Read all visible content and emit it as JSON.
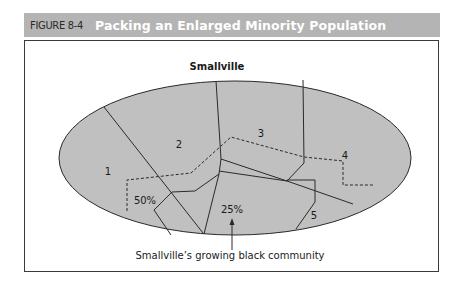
{
  "figure": {
    "number": "FIGURE 8-4",
    "title": "Packing an Enlarged Minority Population"
  },
  "diagram": {
    "city_name": "Smallville",
    "districts": [
      {
        "id": "1",
        "label": "1"
      },
      {
        "id": "2",
        "label": "2"
      },
      {
        "id": "3",
        "label": "3"
      },
      {
        "id": "4",
        "label": "4"
      },
      {
        "id": "5",
        "label": "5"
      }
    ],
    "percentages": [
      {
        "label": "50%"
      },
      {
        "label": "25%"
      }
    ],
    "annotation": "Smallville’s growing black community"
  },
  "colors": {
    "header_bg": "#b4b4b4",
    "ellipse_fill": "#c0c0c0",
    "line": "#2a2a2a",
    "frame_border": "#3a3a3a"
  }
}
